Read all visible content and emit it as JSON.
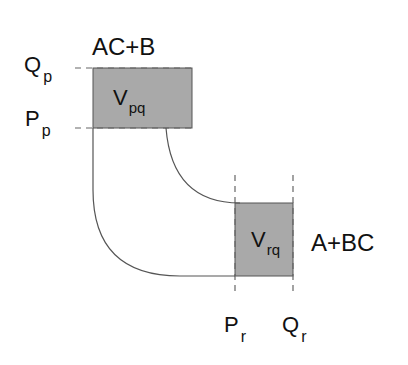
{
  "diagram": {
    "top_box": {
      "label_main": "V",
      "label_sub": "pq",
      "species": "AC+B"
    },
    "bottom_box": {
      "label_main": "V",
      "label_sub": "rq",
      "species": "A+BC"
    },
    "y_axis_labels": [
      {
        "main": "Q",
        "sub": "p"
      },
      {
        "main": "P",
        "sub": "p"
      }
    ],
    "x_axis_labels": [
      {
        "main": "P",
        "sub": "r"
      },
      {
        "main": "Q",
        "sub": "r"
      }
    ],
    "colors": {
      "box_fill": "#a8a8a8",
      "line": "#555555",
      "dash": "#666666"
    }
  }
}
